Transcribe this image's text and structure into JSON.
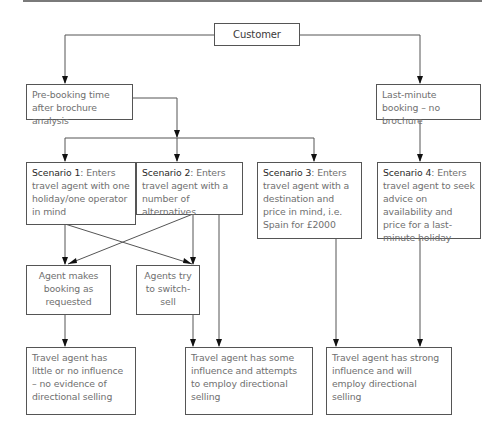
{
  "diagram": {
    "customer": {
      "label": "Customer"
    },
    "branches": {
      "prebooking": {
        "label": "Pre-booking time after brochure analysis"
      },
      "lastminute": {
        "label": "Last-minute booking – no brochure"
      }
    },
    "scenarios": [
      {
        "title": "Scenario 1",
        "text": ": Enters travel agent with one holiday/one operator in mind"
      },
      {
        "title": "Scenario 2",
        "text": ": Enters travel agent with a number of alternatives"
      },
      {
        "title": "Scenario 3",
        "text": ": Enters travel agent with a destination and price in mind, i.e. Spain for £2000"
      },
      {
        "title": "Scenario 4",
        "text": ": Enters travel agent to seek advice on availability and price for a last-minute holiday"
      }
    ],
    "actions": {
      "books": {
        "label": "Agent makes booking as requested"
      },
      "switch": {
        "label": "Agents try to switch-sell"
      }
    },
    "outcomes": [
      {
        "label": "Travel agent has little or no influence – no evidence of directional selling"
      },
      {
        "label": "Travel agent has some influence and attempts to employ directional selling"
      },
      {
        "label": "Travel agent has strong influence and will employ directional selling"
      }
    ]
  }
}
